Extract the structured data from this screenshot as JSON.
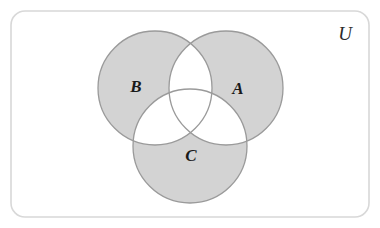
{
  "figure": {
    "type": "venn-diagram",
    "background_color": "#ffffff"
  },
  "universe": {
    "label": "U",
    "label_x": 345,
    "label_y": 33,
    "label_font_size": 19,
    "frame": {
      "x": 11,
      "y": 11,
      "width": 358,
      "height": 206,
      "corner_radius": 14,
      "border_color": "#d8d8d8",
      "border_width": 1.6,
      "fill_color": "#ffffff"
    }
  },
  "style": {
    "shaded_fill": "#d3d3d3",
    "unshaded_fill": "#ffffff",
    "circle_stroke": "#9a9a9a",
    "circle_stroke_width": 1.3,
    "label_color": "#1a1a1a"
  },
  "sets": [
    {
      "id": "B",
      "label": "B",
      "cx": 155,
      "cy": 88,
      "r": 57,
      "shaded": true,
      "label_x": 136,
      "label_y": 86,
      "label_font_size": 17
    },
    {
      "id": "A",
      "label": "A",
      "cx": 226,
      "cy": 88,
      "r": 57,
      "shaded": true,
      "label_x": 238,
      "label_y": 88,
      "label_font_size": 17
    },
    {
      "id": "C",
      "label": "C",
      "cx": 190,
      "cy": 146,
      "r": 57,
      "shaded": true,
      "label_x": 191,
      "label_y": 155,
      "label_font_size": 17
    }
  ],
  "regions": [
    {
      "id": "A-only",
      "expression": "A only",
      "shaded": true
    },
    {
      "id": "B-only",
      "expression": "B only",
      "shaded": true
    },
    {
      "id": "C-only",
      "expression": "C only",
      "shaded": true
    },
    {
      "id": "A-and-B",
      "expression": "A and B",
      "shaded": false
    },
    {
      "id": "A-and-C",
      "expression": "A and C",
      "shaded": false
    },
    {
      "id": "B-and-C",
      "expression": "B and C",
      "shaded": false
    },
    {
      "id": "A-and-B-and-C",
      "expression": "A and B and C",
      "shaded": false
    },
    {
      "id": "outside",
      "expression": "outside all sets",
      "shaded": false
    }
  ]
}
